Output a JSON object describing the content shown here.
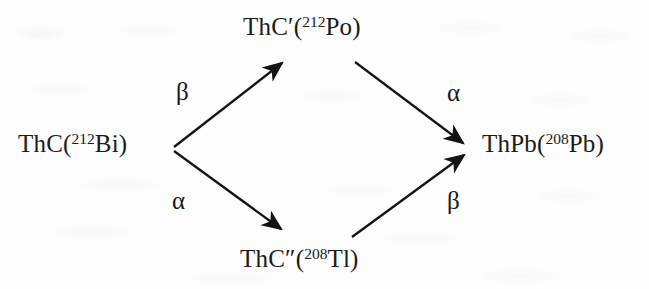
{
  "diagram": {
    "type": "radioactive-decay-branching-diagram",
    "background_color": "#fdfdfd",
    "ink_color": "#1a1a1a",
    "nodes": [
      {
        "id": "parent",
        "position": "left",
        "label_prefix": "ThC(",
        "mass_number": "212",
        "label_suffix": "Bi)",
        "full_text": "ThC(212Bi)"
      },
      {
        "id": "branch-upper",
        "position": "top",
        "label_prefix": "ThC′(",
        "mass_number": "212",
        "label_suffix": "Po)",
        "full_text": "ThC′(212Po)"
      },
      {
        "id": "branch-lower",
        "position": "bottom",
        "label_prefix": "ThC″(",
        "mass_number": "208",
        "label_suffix": "Tl)",
        "full_text": "ThC″(208Tl)"
      },
      {
        "id": "product",
        "position": "right",
        "label_prefix": "ThPb(",
        "mass_number": "208",
        "label_suffix": "Pb)",
        "full_text": "ThPb(208Pb)"
      }
    ],
    "arrows": [
      {
        "id": "parent-to-upper",
        "from": "parent",
        "to": "branch-upper",
        "decay_label": "β",
        "label_position": "upper-left"
      },
      {
        "id": "parent-to-lower",
        "from": "parent",
        "to": "branch-lower",
        "decay_label": "α",
        "label_position": "lower-left"
      },
      {
        "id": "upper-to-product",
        "from": "branch-upper",
        "to": "product",
        "decay_label": "α",
        "label_position": "upper-right"
      },
      {
        "id": "lower-to-product",
        "from": "branch-lower",
        "to": "product",
        "decay_label": "β",
        "label_position": "lower-right"
      }
    ]
  }
}
